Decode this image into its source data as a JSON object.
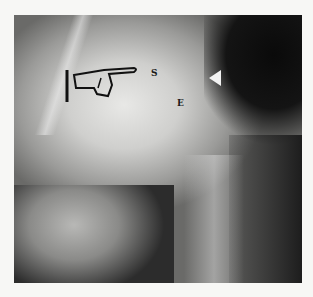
{
  "image": {
    "description": "Radiograph of hip/pelvis region with pointing-hand annotation and letter labels",
    "labels": {
      "s": "S",
      "e": "E"
    },
    "annotations": [
      "pointing-hand",
      "arrowhead",
      "vertical-bar"
    ]
  }
}
